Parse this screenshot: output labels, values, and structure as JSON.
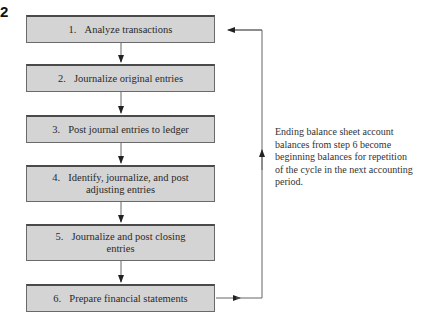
{
  "figure": {
    "number_fragment": "2"
  },
  "steps": [
    {
      "num": "1.",
      "line1": "Analyze transactions",
      "line2": ""
    },
    {
      "num": "2.",
      "line1": "Journalize original entries",
      "line2": ""
    },
    {
      "num": "3.",
      "line1": "Post journal entries to ledger",
      "line2": ""
    },
    {
      "num": "4.",
      "line1": "Identify, journalize, and post",
      "line2": "adjusting entries"
    },
    {
      "num": "5.",
      "line1": "Journalize and post closing",
      "line2": "entries"
    },
    {
      "num": "6.",
      "line1": "Prepare financial statements",
      "line2": ""
    }
  ],
  "note": {
    "text": "Ending balance sheet account balances from step 6 become beginning balances for repetition of the cycle in the next accounting period."
  },
  "colors": {
    "box_fill": "#d4d4d4",
    "box_border": "#4a4a4a",
    "line": "#555555"
  }
}
